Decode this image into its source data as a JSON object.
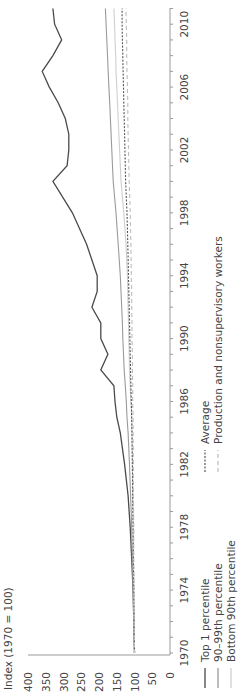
{
  "chart_data": {
    "type": "line",
    "orientation": "rotated 90° counter-clockwise (time runs bottom-to-top, values increase leftward)",
    "title": "",
    "ylabel": "Index (1970 = 100)",
    "xlabel": "",
    "ylim": [
      0,
      400
    ],
    "yticks": [
      400,
      350,
      300,
      250,
      200,
      150,
      100,
      50,
      0
    ],
    "xticks": [
      1970,
      1974,
      1978,
      1982,
      1986,
      1990,
      1994,
      1998,
      2002,
      2006,
      2010
    ],
    "xlim": [
      1970,
      2011
    ],
    "grid": false,
    "legend_position": "below plot (right side in rotated view)",
    "legend": [
      {
        "label": "Top 1 percentile",
        "style": "solid dark"
      },
      {
        "label": "90–99th percentile",
        "style": "solid gray"
      },
      {
        "label": "Bottom 90th percentile",
        "style": "solid light gray"
      },
      {
        "label": "Average",
        "style": "dotted dark"
      },
      {
        "label": "Production and nonsupervisory workers",
        "style": "dashed light gray"
      }
    ],
    "x": [
      1970,
      1972,
      1974,
      1976,
      1978,
      1980,
      1982,
      1984,
      1985,
      1986,
      1987,
      1988,
      1989,
      1990,
      1991,
      1992,
      1993,
      1994,
      1996,
      1998,
      2000,
      2001,
      2002,
      2003,
      2004,
      2005,
      2006,
      2007,
      2008,
      2009,
      2010,
      2011
    ],
    "series": [
      {
        "name": "Top 1 percentile",
        "values": [
          100,
          102,
          104,
          108,
          112,
          118,
          128,
          140,
          150,
          155,
          158,
          195,
          175,
          195,
          195,
          220,
          205,
          205,
          235,
          275,
          330,
          290,
          285,
          285,
          295,
          315,
          340,
          360,
          330,
          305,
          325,
          330
        ]
      },
      {
        "name": "90–99th percentile",
        "values": [
          100,
          102,
          104,
          106,
          108,
          111,
          114,
          118,
          121,
          123,
          126,
          129,
          131,
          133,
          134,
          136,
          138,
          140,
          146,
          152,
          160,
          162,
          164,
          166,
          168,
          170,
          172,
          174,
          176,
          178,
          180,
          182
        ]
      },
      {
        "name": "Bottom 90th percentile",
        "values": [
          100,
          101,
          102,
          103,
          104,
          105,
          106,
          107,
          108,
          110,
          112,
          114,
          115,
          116,
          117,
          118,
          119,
          120,
          124,
          130,
          138,
          140,
          142,
          144,
          146,
          148,
          150,
          152,
          153,
          155,
          156,
          158
        ]
      },
      {
        "name": "Average",
        "values": [
          100,
          101,
          102,
          103,
          104,
          105,
          106,
          107,
          108,
          109,
          110,
          111,
          112,
          113,
          114,
          115,
          116,
          117,
          119,
          121,
          125,
          126,
          127,
          128,
          129,
          130,
          131,
          132,
          133,
          134,
          135,
          135
        ]
      },
      {
        "name": "Production and nonsupervisory workers",
        "values": [
          100,
          101,
          101,
          102,
          102,
          103,
          103,
          104,
          104,
          105,
          105,
          106,
          106,
          107,
          107,
          108,
          108,
          109,
          110,
          112,
          115,
          116,
          117,
          118,
          119,
          119,
          120,
          121,
          122,
          122,
          123,
          124
        ]
      }
    ]
  },
  "axis": {
    "ylabel": "Index (1970 = 100)",
    "yticks": [
      "400",
      "350",
      "300",
      "250",
      "200",
      "150",
      "100",
      "50",
      "0"
    ],
    "xticks": [
      "1970",
      "1974",
      "1978",
      "1982",
      "1986",
      "1990",
      "1994",
      "1998",
      "2002",
      "2006",
      "2010"
    ]
  },
  "legend": {
    "col1": [
      "Top 1 percentile",
      "90–99th percentile",
      "Bottom 90th percentile"
    ],
    "col2": [
      "Average",
      "Production and nonsupervisory workers"
    ]
  },
  "colors": {
    "top1": "#4a4a4a",
    "p90_99": "#9a9a9a",
    "bottom90": "#cfcfcf",
    "average": "#555555",
    "production": "#bdbdbd",
    "axis": "#9a9a9a"
  }
}
